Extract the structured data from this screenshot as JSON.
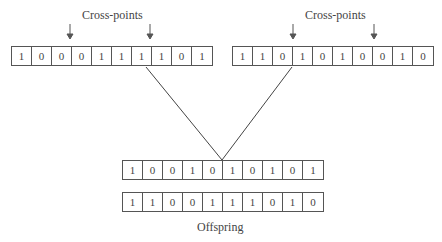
{
  "parent1": {
    "label": "Cross-points",
    "bits": [
      "1",
      "0",
      "0",
      "0",
      "1",
      "1",
      "1",
      "1",
      "0",
      "1"
    ],
    "cross_points_after_index": [
      2,
      6
    ]
  },
  "parent2": {
    "label": "Cross-points",
    "bits": [
      "1",
      "1",
      "0",
      "1",
      "0",
      "1",
      "0",
      "0",
      "1",
      "0"
    ],
    "cross_points_after_index": [
      2,
      6
    ]
  },
  "offspring": {
    "label": "Offspring",
    "child1": [
      "1",
      "0",
      "0",
      "1",
      "0",
      "1",
      "0",
      "1",
      "0",
      "1"
    ],
    "child2": [
      "1",
      "1",
      "0",
      "0",
      "1",
      "1",
      "1",
      "0",
      "1",
      "0"
    ]
  }
}
